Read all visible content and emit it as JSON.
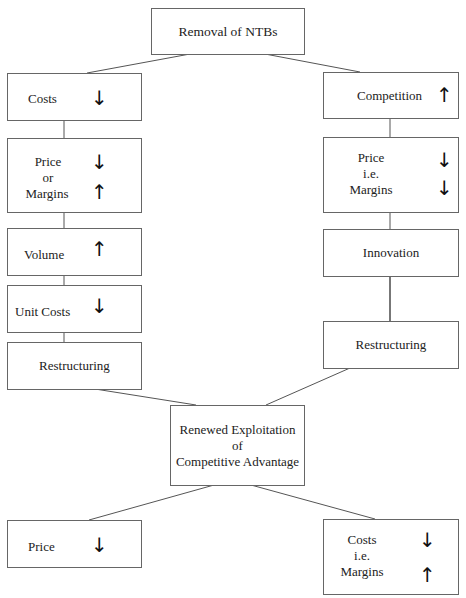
{
  "diagram": {
    "top": {
      "label": "Removal of NTBs"
    },
    "left_branch": [
      {
        "label": "Costs",
        "arrows": [
          "down"
        ]
      },
      {
        "lines": [
          "Price",
          "or",
          "Margins"
        ],
        "arrows": [
          "down",
          "up"
        ]
      },
      {
        "label": "Volume",
        "arrows": [
          "up"
        ]
      },
      {
        "label": "Unit Costs",
        "arrows": [
          "down"
        ]
      },
      {
        "label": "Restructuring",
        "arrows": []
      }
    ],
    "right_branch": [
      {
        "label": "Competition",
        "arrows": [
          "up"
        ]
      },
      {
        "lines": [
          "Price",
          "i.e.",
          "Margins"
        ],
        "arrows": [
          "down",
          "down"
        ]
      },
      {
        "label": "Innovation",
        "arrows": []
      },
      {
        "label": "Restructuring",
        "arrows": []
      }
    ],
    "center": {
      "lines": [
        "Renewed Exploitation",
        "of",
        "Competitive Advantage"
      ]
    },
    "outcomes": {
      "left": {
        "label": "Price",
        "arrows": [
          "down"
        ]
      },
      "right": {
        "lines": [
          "Costs",
          "i.e.",
          "Margins"
        ],
        "arrows": [
          "down",
          "up"
        ]
      }
    },
    "glyphs": {
      "up": "↑",
      "down": "↓"
    },
    "colors": {
      "line": "#555555",
      "border": "#666666",
      "text": "#222222"
    }
  }
}
